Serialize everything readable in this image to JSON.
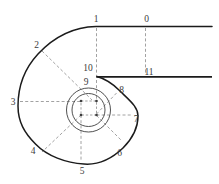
{
  "figure": {
    "background_color": "#ffffff",
    "curve_color": "#1b1b1b",
    "thin_line_color": "#3d3d3d",
    "dashed_line_color": "#8a8a8a",
    "label_color": "#3c3c3c"
  },
  "labels": [
    {
      "id": "station-label-0",
      "text": "0",
      "x": 146.5,
      "y": 19
    },
    {
      "id": "station-label-1",
      "text": "1",
      "x": 96,
      "y": 19
    },
    {
      "id": "station-label-2",
      "text": "2",
      "x": 36.5,
      "y": 45
    },
    {
      "id": "station-label-3",
      "text": "3",
      "x": 13,
      "y": 102
    },
    {
      "id": "station-label-4",
      "text": "4",
      "x": 33,
      "y": 151
    },
    {
      "id": "station-label-5",
      "text": "5",
      "x": 82,
      "y": 171
    },
    {
      "id": "station-label-6",
      "text": "6",
      "x": 119.5,
      "y": 153
    },
    {
      "id": "station-label-7",
      "text": "7",
      "x": 136,
      "y": 119
    },
    {
      "id": "station-label-8",
      "text": "8",
      "x": 121.5,
      "y": 90
    },
    {
      "id": "station-label-9",
      "text": "9",
      "x": 86,
      "y": 82
    },
    {
      "id": "station-label-10",
      "text": "10",
      "x": 88,
      "y": 68
    },
    {
      "id": "station-label-11",
      "text": "11",
      "x": 149,
      "y": 71.5
    }
  ]
}
